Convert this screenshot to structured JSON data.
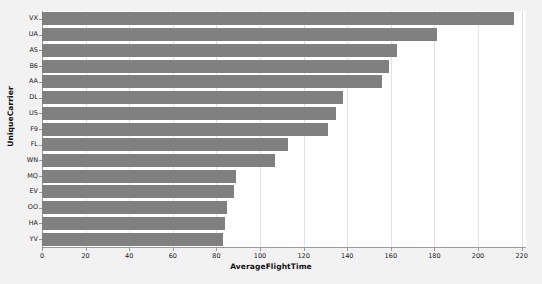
{
  "chart_data": {
    "type": "bar",
    "orientation": "horizontal",
    "title": "",
    "xlabel": "AverageFlightTime",
    "ylabel": "UniqueCarrier",
    "categories": [
      "VX",
      "UA",
      "AS",
      "B6",
      "AA",
      "DL",
      "US",
      "F9",
      "FL",
      "WN",
      "MQ",
      "EV",
      "OO",
      "HA",
      "YV"
    ],
    "values": [
      216.5,
      181,
      163,
      159,
      156,
      138,
      135,
      131,
      113,
      107,
      89,
      88,
      85,
      84,
      83
    ],
    "xlim": [
      0,
      222
    ],
    "ylim": [
      0,
      15
    ],
    "xticks": [
      0,
      20,
      40,
      60,
      80,
      100,
      120,
      140,
      160,
      180,
      200,
      220
    ],
    "xtick_labels": [
      "0",
      "20",
      "40",
      "60",
      "80",
      "100",
      "120",
      "140",
      "160",
      "180",
      "200",
      "220"
    ],
    "grid": "vertical",
    "legend": "none",
    "bar_color": "#808080",
    "plot_background": "#ffffff",
    "figure_background": "#f2f2f2"
  }
}
